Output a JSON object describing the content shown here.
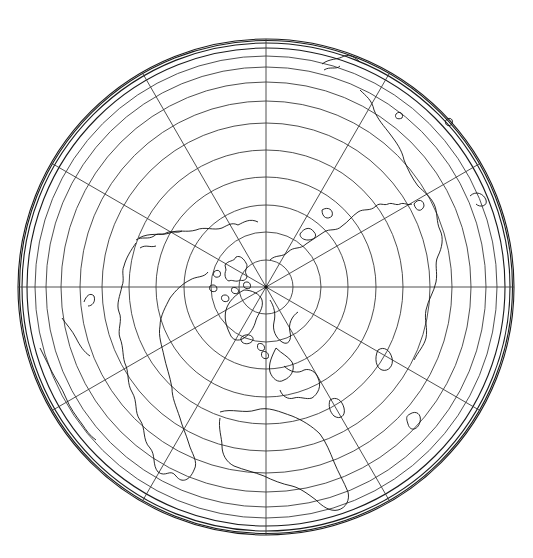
{
  "map": {
    "projection": "azimuthal equidistant (north polar aspect)",
    "center": {
      "x": 266,
      "y": 287
    },
    "radius": 248,
    "colors": {
      "background": "#ffffff",
      "graticule": "#3a3a3a",
      "coastline": "#111111"
    },
    "meridian_count": 12,
    "meridian_spacing_deg": 30,
    "latitude_ring_radii": [
      27,
      55,
      82,
      110,
      137,
      164,
      186,
      205,
      220,
      231,
      239,
      244,
      246.5,
      248
    ],
    "labels": []
  }
}
